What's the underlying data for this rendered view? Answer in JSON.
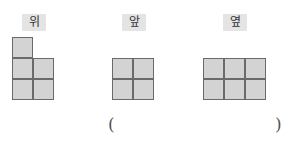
{
  "views": {
    "top": {
      "label": "위",
      "cells": [
        [
          0,
          0
        ],
        [
          0,
          1
        ],
        [
          1,
          1
        ],
        [
          0,
          2
        ],
        [
          1,
          2
        ]
      ]
    },
    "front": {
      "label": "앞",
      "cells": [
        [
          0,
          0
        ],
        [
          1,
          0
        ],
        [
          0,
          1
        ],
        [
          1,
          1
        ]
      ]
    },
    "side": {
      "label": "옆",
      "cells": [
        [
          0,
          0
        ],
        [
          1,
          0
        ],
        [
          2,
          0
        ],
        [
          0,
          1
        ],
        [
          1,
          1
        ],
        [
          2,
          1
        ]
      ]
    }
  },
  "answer": {
    "open_paren": "(",
    "close_paren": ")",
    "value": ""
  },
  "colors": {
    "cell_fill": "#d3d3d3",
    "cell_border": "#6a6a6a",
    "badge_bg": "#e4e4e4"
  }
}
